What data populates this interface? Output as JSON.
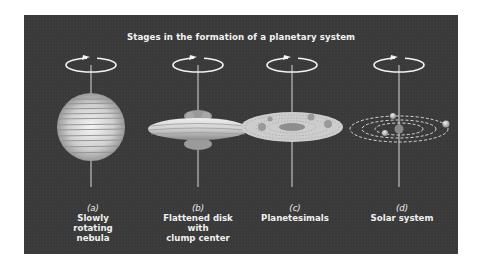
{
  "title": "Stages in the formation of a planetary system",
  "colors": {
    "panel_background": "#3a3a3a",
    "text": "#f0f0f0",
    "object_light": "#d9d9d9",
    "object_shadow": "#8a8a8a"
  },
  "stages": [
    {
      "letter": "(a)",
      "lines": [
        "Slowly",
        "rotating",
        "nebula"
      ],
      "icon": "rotating-sphere-nebula"
    },
    {
      "letter": "(b)",
      "lines": [
        "Flattened disk",
        "with",
        "clump center"
      ],
      "icon": "flattened-disk-with-central-clump"
    },
    {
      "letter": "(c)",
      "lines": [
        "Planetesimals"
      ],
      "icon": "planetesimal-disk"
    },
    {
      "letter": "(d)",
      "lines": [
        "Solar system"
      ],
      "icon": "solar-system-orbits"
    }
  ],
  "rotation_indicator": "circular-arrow-around-axis"
}
